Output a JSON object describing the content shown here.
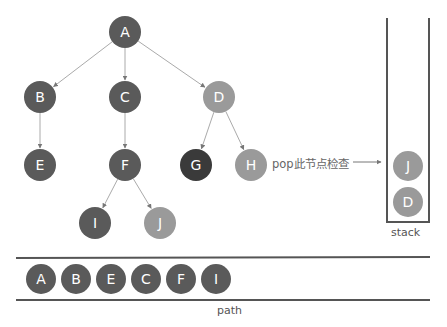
{
  "diagram": {
    "type": "dfs-traversal",
    "colors": {
      "dark": "#5a5a5a",
      "darkest": "#3a3a3a",
      "light": "#9a9a9a",
      "edge": "#aaaaaa",
      "frame": "#555555",
      "text": "#555555"
    },
    "tree": {
      "nodes": [
        {
          "id": "A",
          "label": "A",
          "x": 125,
          "y": 32,
          "shade": "dark"
        },
        {
          "id": "B",
          "label": "B",
          "x": 40,
          "y": 97,
          "shade": "dark"
        },
        {
          "id": "C",
          "label": "C",
          "x": 125,
          "y": 97,
          "shade": "dark"
        },
        {
          "id": "D",
          "label": "D",
          "x": 219,
          "y": 97,
          "shade": "light"
        },
        {
          "id": "E",
          "label": "E",
          "x": 40,
          "y": 165,
          "shade": "dark"
        },
        {
          "id": "F",
          "label": "F",
          "x": 125,
          "y": 165,
          "shade": "dark"
        },
        {
          "id": "G",
          "label": "G",
          "x": 196,
          "y": 165,
          "shade": "darkest"
        },
        {
          "id": "H",
          "label": "H",
          "x": 251,
          "y": 165,
          "shade": "light"
        },
        {
          "id": "I",
          "label": "I",
          "x": 95,
          "y": 223,
          "shade": "dark"
        },
        {
          "id": "J",
          "label": "J",
          "x": 160,
          "y": 223,
          "shade": "light"
        }
      ],
      "edges": [
        [
          "A",
          "B"
        ],
        [
          "A",
          "C"
        ],
        [
          "A",
          "D"
        ],
        [
          "B",
          "E"
        ],
        [
          "C",
          "F"
        ],
        [
          "D",
          "G"
        ],
        [
          "D",
          "H"
        ],
        [
          "F",
          "I"
        ],
        [
          "F",
          "J"
        ]
      ]
    },
    "pop_annotation": {
      "text": "pop此节点检查"
    },
    "stack": {
      "label": "stack",
      "items_top_to_bottom": [
        "J",
        "D"
      ]
    },
    "path": {
      "label": "path",
      "items": [
        "A",
        "B",
        "E",
        "C",
        "F",
        "I"
      ]
    }
  }
}
